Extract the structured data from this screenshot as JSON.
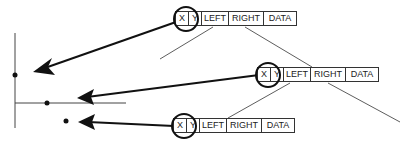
{
  "diagram": {
    "nodes": [
      {
        "id": "node-1",
        "fields": [
          "X",
          "Y",
          "LEFT",
          "RIGHT",
          "DATA"
        ]
      },
      {
        "id": "node-2",
        "fields": [
          "X",
          "Y",
          "LEFT",
          "RIGHT",
          "DATA"
        ]
      },
      {
        "id": "node-3",
        "fields": [
          "X",
          "Y",
          "LEFT",
          "RIGHT",
          "DATA"
        ]
      }
    ],
    "points": [
      {
        "id": "point-1",
        "label": ""
      },
      {
        "id": "point-2",
        "label": ""
      },
      {
        "id": "point-3",
        "label": ""
      }
    ],
    "colors": {
      "line": "#111111",
      "border": "#333333",
      "background": "#ffffff"
    }
  }
}
